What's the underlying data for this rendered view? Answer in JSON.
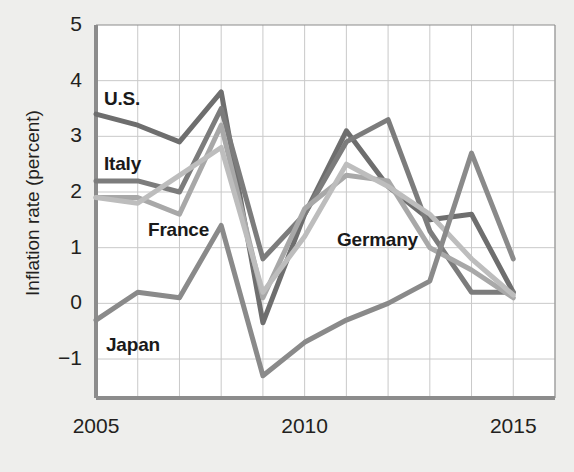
{
  "chart_data": {
    "type": "line",
    "title": "",
    "xlabel": "",
    "ylabel": "Inflation rate (percent)",
    "x": [
      2005,
      2006,
      2007,
      2008,
      2009,
      2010,
      2011,
      2012,
      2013,
      2014,
      2015
    ],
    "xlim": [
      2005,
      2016
    ],
    "ylim": [
      -1.7,
      5
    ],
    "xticks": [
      2005,
      2010,
      2015
    ],
    "xtick_labels": [
      "2005",
      "2010",
      "2015"
    ],
    "yticks": [
      -1,
      0,
      1,
      2,
      3,
      4,
      5
    ],
    "ytick_labels": [
      "−1",
      "0",
      "1",
      "2",
      "3",
      "4",
      "5"
    ],
    "grid": true,
    "legend_position": "inline-labels",
    "series": [
      {
        "name": "U.S.",
        "color": "#6e6e6e",
        "label_x": 104,
        "label_y": 88,
        "values": [
          3.4,
          3.2,
          2.9,
          3.8,
          -0.35,
          1.6,
          3.1,
          2.1,
          1.5,
          1.6,
          0.2
        ]
      },
      {
        "name": "Italy",
        "color": "#7c7c7c",
        "label_x": 104,
        "label_y": 153,
        "values": [
          2.2,
          2.2,
          2.0,
          3.5,
          0.8,
          1.6,
          2.9,
          3.3,
          1.3,
          0.2,
          0.2
        ]
      },
      {
        "name": "France",
        "color": "#a8a8a8",
        "label_x": 148,
        "label_y": 219,
        "values": [
          1.9,
          1.9,
          1.6,
          3.2,
          0.1,
          1.7,
          2.3,
          2.2,
          1.0,
          0.6,
          0.1
        ]
      },
      {
        "name": "Germany",
        "color": "#bdbdbd",
        "label_x": 337,
        "label_y": 229,
        "values": [
          1.9,
          1.8,
          2.3,
          2.8,
          0.2,
          1.2,
          2.5,
          2.1,
          1.6,
          0.8,
          0.15
        ]
      },
      {
        "name": "Japan",
        "color": "#8a8a8a",
        "label_x": 106,
        "label_y": 334,
        "values": [
          -0.3,
          0.2,
          0.1,
          1.4,
          -1.3,
          -0.7,
          -0.3,
          0.0,
          0.4,
          2.7,
          0.8
        ]
      }
    ]
  },
  "axes": {
    "y_axis_title": "Inflation rate (percent)"
  }
}
